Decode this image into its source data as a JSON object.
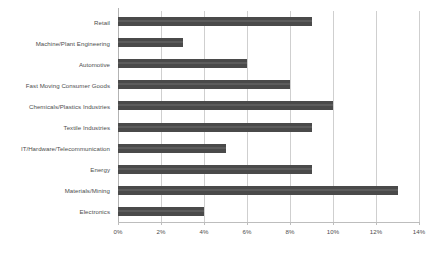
{
  "chart_data": {
    "type": "bar",
    "orientation": "horizontal",
    "title": "",
    "subtitle": "",
    "xlabel": "",
    "ylabel": "",
    "categories": [
      "Retail",
      "Machine/Plant Engineering",
      "Automotive",
      "Fast Moving Consumer Goods",
      "Chemicals/Plastics Industries",
      "Textile Industries",
      "IT/Hardware/Telecommunication",
      "Energy",
      "Materials/Mining",
      "Electronics"
    ],
    "values": [
      9,
      3,
      6,
      8,
      10,
      9,
      5,
      9,
      13,
      4
    ],
    "value_unit": "%",
    "xlim": [
      0,
      14
    ],
    "xticks": [
      0,
      2,
      4,
      6,
      8,
      10,
      12,
      14
    ],
    "xtick_labels": [
      "0%",
      "2%",
      "4%",
      "6%",
      "8%",
      "10%",
      "12%",
      "14%"
    ],
    "grid": "vertical",
    "legend": "none",
    "bar_color": "#4a4a4a",
    "gridline_color": "#cfcfcf",
    "axis_color": "#b3b3b3",
    "background_color": "#ffffff",
    "annotations": []
  }
}
